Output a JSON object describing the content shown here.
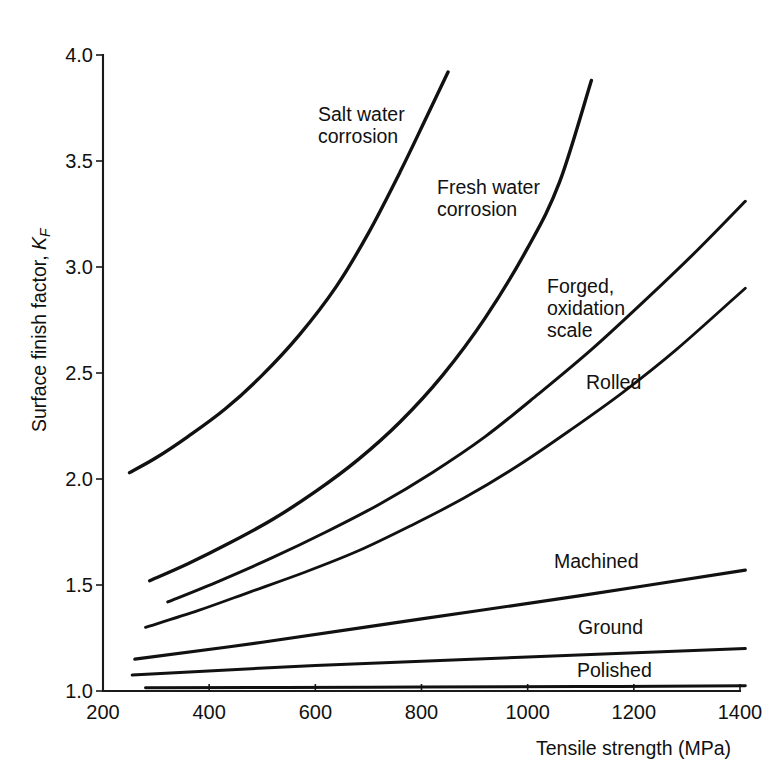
{
  "chart_data": {
    "type": "line",
    "title": "",
    "xlabel": "Tensile strength (MPa)",
    "ylabel": "Surface finish factor, K_F",
    "ylabel_main": "Surface finish factor, ",
    "ylabel_symbol": "K",
    "ylabel_subscript": "F",
    "xlim": [
      200,
      1400
    ],
    "ylim": [
      1.0,
      4.0
    ],
    "xticks": [
      200,
      400,
      600,
      800,
      1000,
      1200,
      1400
    ],
    "yticks": [
      "1.0",
      "1.5",
      "2.0",
      "2.5",
      "3.0",
      "3.5",
      "4.0"
    ],
    "ytick_values": [
      1.0,
      1.5,
      2.0,
      2.5,
      3.0,
      3.5,
      4.0
    ],
    "grid": false,
    "legend": "inline-curve-labels",
    "line_color": "#111111",
    "series": [
      {
        "name": "Salt water corrosion",
        "label_lines": [
          "Salt water",
          "corrosion"
        ],
        "x": [
          250,
          300,
          360,
          430,
          500,
          570,
          640,
          700,
          760,
          810,
          850
        ],
        "y": [
          2.03,
          2.1,
          2.2,
          2.33,
          2.49,
          2.68,
          2.91,
          3.16,
          3.45,
          3.71,
          3.92
        ]
      },
      {
        "name": "Fresh water corrosion",
        "label_lines": [
          "Fresh water",
          "corrosion"
        ],
        "x": [
          288,
          360,
          440,
          520,
          600,
          680,
          760,
          840,
          920,
          1000,
          1060,
          1120
        ],
        "y": [
          1.52,
          1.6,
          1.7,
          1.81,
          1.94,
          2.09,
          2.27,
          2.49,
          2.76,
          3.09,
          3.4,
          3.88
        ]
      },
      {
        "name": "Forged, oxidation scale",
        "label_lines": [
          "Forged,",
          "oxidation",
          "scale"
        ],
        "x": [
          322,
          420,
          520,
          620,
          720,
          820,
          920,
          1020,
          1120,
          1220,
          1320,
          1410
        ],
        "y": [
          1.42,
          1.52,
          1.63,
          1.75,
          1.88,
          2.03,
          2.2,
          2.4,
          2.61,
          2.84,
          3.08,
          3.31
        ]
      },
      {
        "name": "Rolled",
        "label_lines": [
          "Rolled"
        ],
        "x": [
          280,
          380,
          480,
          580,
          680,
          780,
          880,
          980,
          1080,
          1180,
          1280,
          1410
        ],
        "y": [
          1.3,
          1.38,
          1.47,
          1.56,
          1.66,
          1.78,
          1.91,
          2.06,
          2.23,
          2.41,
          2.61,
          2.9
        ]
      },
      {
        "name": "Machined",
        "label_lines": [
          "Machined"
        ],
        "x": [
          260,
          500,
          800,
          1100,
          1410
        ],
        "y": [
          1.15,
          1.23,
          1.34,
          1.45,
          1.57
        ]
      },
      {
        "name": "Ground",
        "label_lines": [
          "Ground"
        ],
        "x": [
          255,
          600,
          1000,
          1410
        ],
        "y": [
          1.075,
          1.12,
          1.16,
          1.2
        ]
      },
      {
        "name": "Polished",
        "label_lines": [
          "Polished"
        ],
        "x": [
          280,
          700,
          1100,
          1410
        ],
        "y": [
          1.015,
          1.018,
          1.021,
          1.025
        ]
      }
    ],
    "curve_label_positions": [
      {
        "name": "Salt water corrosion",
        "left": 318,
        "top": 104
      },
      {
        "name": "Fresh water corrosion",
        "left": 437,
        "top": 177
      },
      {
        "name": "Forged, oxidation scale",
        "left": 547,
        "top": 276
      },
      {
        "name": "Rolled",
        "left": 586,
        "top": 372
      },
      {
        "name": "Machined",
        "left": 554,
        "top": 551
      },
      {
        "name": "Ground",
        "left": 578,
        "top": 617
      },
      {
        "name": "Polished",
        "left": 577,
        "top": 660
      }
    ]
  }
}
